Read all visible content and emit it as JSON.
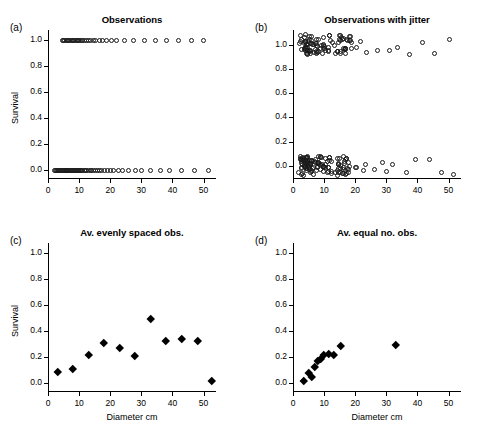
{
  "figure": {
    "panels": [
      {
        "label": "(a)",
        "title": "Observations",
        "ylabel": "Survival",
        "xlabel": ""
      },
      {
        "label": "(b)",
        "title": "Observations with jitter",
        "ylabel": "",
        "xlabel": ""
      },
      {
        "label": "(c)",
        "title": "Av. evenly spaced obs.",
        "ylabel": "Survival",
        "xlabel": "Diameter cm"
      },
      {
        "label": "(d)",
        "title": "Av. equal no. obs.",
        "ylabel": "",
        "xlabel": "Diameter cm"
      }
    ],
    "ytick_labels": [
      "0.0",
      "0.2",
      "0.4",
      "0.6",
      "0.8",
      "1.0"
    ],
    "xtick_labels": [
      "0",
      "10",
      "20",
      "30",
      "40",
      "50"
    ]
  },
  "chart_data": [
    {
      "id": "a",
      "type": "scatter",
      "title": "Observations",
      "panel_label": "(a)",
      "xlabel": "",
      "ylabel": "Survival",
      "xlim": [
        0,
        54
      ],
      "ylim": [
        -0.06,
        1.08
      ],
      "xticks": [
        0,
        10,
        20,
        30,
        40,
        50
      ],
      "yticks": [
        0.0,
        0.2,
        0.4,
        0.6,
        0.8,
        1.0
      ],
      "grid": false,
      "legend": "none",
      "marker": "open-circle",
      "points": [
        {
          "x": 2.0,
          "y": 0
        },
        {
          "x": 2.4,
          "y": 0
        },
        {
          "x": 2.8,
          "y": 0
        },
        {
          "x": 3.1,
          "y": 0
        },
        {
          "x": 3.4,
          "y": 0
        },
        {
          "x": 3.7,
          "y": 0
        },
        {
          "x": 4.0,
          "y": 0
        },
        {
          "x": 4.3,
          "y": 0
        },
        {
          "x": 4.6,
          "y": 0
        },
        {
          "x": 4.9,
          "y": 0
        },
        {
          "x": 5.2,
          "y": 0
        },
        {
          "x": 5.5,
          "y": 0
        },
        {
          "x": 5.8,
          "y": 0
        },
        {
          "x": 6.1,
          "y": 0
        },
        {
          "x": 6.4,
          "y": 0
        },
        {
          "x": 6.7,
          "y": 0
        },
        {
          "x": 7.0,
          "y": 0
        },
        {
          "x": 7.3,
          "y": 0
        },
        {
          "x": 7.6,
          "y": 0
        },
        {
          "x": 7.9,
          "y": 0
        },
        {
          "x": 8.2,
          "y": 0
        },
        {
          "x": 8.5,
          "y": 0
        },
        {
          "x": 8.8,
          "y": 0
        },
        {
          "x": 9.1,
          "y": 0
        },
        {
          "x": 9.4,
          "y": 0
        },
        {
          "x": 9.7,
          "y": 0
        },
        {
          "x": 10.0,
          "y": 0
        },
        {
          "x": 10.4,
          "y": 0
        },
        {
          "x": 10.8,
          "y": 0
        },
        {
          "x": 11.2,
          "y": 0
        },
        {
          "x": 11.6,
          "y": 0
        },
        {
          "x": 12.0,
          "y": 0
        },
        {
          "x": 12.5,
          "y": 0
        },
        {
          "x": 13.0,
          "y": 0
        },
        {
          "x": 13.5,
          "y": 0
        },
        {
          "x": 14.0,
          "y": 0
        },
        {
          "x": 14.6,
          "y": 0
        },
        {
          "x": 15.2,
          "y": 0
        },
        {
          "x": 15.8,
          "y": 0
        },
        {
          "x": 16.5,
          "y": 0
        },
        {
          "x": 17.2,
          "y": 0
        },
        {
          "x": 18.0,
          "y": 0
        },
        {
          "x": 19.0,
          "y": 0
        },
        {
          "x": 20.0,
          "y": 0
        },
        {
          "x": 21.0,
          "y": 0
        },
        {
          "x": 22.5,
          "y": 0
        },
        {
          "x": 24.0,
          "y": 0
        },
        {
          "x": 26.0,
          "y": 0
        },
        {
          "x": 28.0,
          "y": 0
        },
        {
          "x": 30.0,
          "y": 0
        },
        {
          "x": 33.0,
          "y": 0
        },
        {
          "x": 36.0,
          "y": 0
        },
        {
          "x": 39.0,
          "y": 0
        },
        {
          "x": 43.0,
          "y": 0
        },
        {
          "x": 47.0,
          "y": 0
        },
        {
          "x": 51.5,
          "y": 0
        },
        {
          "x": 4.5,
          "y": 1
        },
        {
          "x": 5.0,
          "y": 1
        },
        {
          "x": 5.4,
          "y": 1
        },
        {
          "x": 5.8,
          "y": 1
        },
        {
          "x": 6.2,
          "y": 1
        },
        {
          "x": 6.6,
          "y": 1
        },
        {
          "x": 7.0,
          "y": 1
        },
        {
          "x": 7.4,
          "y": 1
        },
        {
          "x": 7.8,
          "y": 1
        },
        {
          "x": 8.2,
          "y": 1
        },
        {
          "x": 8.6,
          "y": 1
        },
        {
          "x": 9.0,
          "y": 1
        },
        {
          "x": 9.4,
          "y": 1
        },
        {
          "x": 9.8,
          "y": 1
        },
        {
          "x": 10.2,
          "y": 1
        },
        {
          "x": 10.7,
          "y": 1
        },
        {
          "x": 11.2,
          "y": 1
        },
        {
          "x": 11.8,
          "y": 1
        },
        {
          "x": 12.4,
          "y": 1
        },
        {
          "x": 13.0,
          "y": 1
        },
        {
          "x": 13.7,
          "y": 1
        },
        {
          "x": 14.5,
          "y": 1
        },
        {
          "x": 15.4,
          "y": 1
        },
        {
          "x": 16.4,
          "y": 1
        },
        {
          "x": 17.5,
          "y": 1
        },
        {
          "x": 18.8,
          "y": 1
        },
        {
          "x": 20.3,
          "y": 1
        },
        {
          "x": 22.0,
          "y": 1
        },
        {
          "x": 24.5,
          "y": 1
        },
        {
          "x": 27.5,
          "y": 1
        },
        {
          "x": 31.0,
          "y": 1
        },
        {
          "x": 34.5,
          "y": 1
        },
        {
          "x": 38.0,
          "y": 1
        },
        {
          "x": 42.0,
          "y": 1
        },
        {
          "x": 46.0,
          "y": 1
        },
        {
          "x": 50.0,
          "y": 1
        }
      ]
    },
    {
      "id": "b",
      "type": "scatter",
      "title": "Observations with jitter",
      "panel_label": "(b)",
      "xlabel": "",
      "ylabel": "",
      "xlim": [
        0,
        54
      ],
      "ylim": [
        -0.1,
        1.12
      ],
      "xticks": [
        0,
        10,
        20,
        30,
        40,
        50
      ],
      "yticks": [
        0.0,
        0.2,
        0.4,
        0.6,
        0.8,
        1.0
      ],
      "grid": false,
      "legend": "none",
      "marker": "open-circle",
      "note": "Same data as panel (a) with random jitter added in x and y; dense cloud near x=5-15 at y~0 and y~1"
    },
    {
      "id": "c",
      "type": "scatter",
      "title": "Av. evenly spaced obs.",
      "panel_label": "(c)",
      "xlabel": "Diameter cm",
      "ylabel": "Survival",
      "xlim": [
        0,
        54
      ],
      "ylim": [
        -0.06,
        1.08
      ],
      "xticks": [
        0,
        10,
        20,
        30,
        40,
        50
      ],
      "yticks": [
        0.0,
        0.2,
        0.4,
        0.6,
        0.8,
        1.0
      ],
      "grid": false,
      "legend": "none",
      "marker": "filled-diamond",
      "points": [
        {
          "x": 3.0,
          "y": 0.09
        },
        {
          "x": 8.0,
          "y": 0.11
        },
        {
          "x": 13.0,
          "y": 0.22
        },
        {
          "x": 18.0,
          "y": 0.31
        },
        {
          "x": 23.0,
          "y": 0.27
        },
        {
          "x": 28.0,
          "y": 0.21
        },
        {
          "x": 33.0,
          "y": 0.5
        },
        {
          "x": 38.0,
          "y": 0.33
        },
        {
          "x": 43.0,
          "y": 0.34
        },
        {
          "x": 48.0,
          "y": 0.33
        },
        {
          "x": 52.5,
          "y": 0.02
        }
      ]
    },
    {
      "id": "d",
      "type": "scatter",
      "title": "Av. equal no. obs.",
      "panel_label": "(d)",
      "xlabel": "Diameter cm",
      "ylabel": "",
      "xlim": [
        0,
        54
      ],
      "ylim": [
        -0.06,
        1.08
      ],
      "xticks": [
        0,
        10,
        20,
        30,
        40,
        50
      ],
      "yticks": [
        0.0,
        0.2,
        0.4,
        0.6,
        0.8,
        1.0
      ],
      "grid": false,
      "legend": "none",
      "marker": "filled-diamond",
      "points": [
        {
          "x": 3.5,
          "y": 0.02
        },
        {
          "x": 5.0,
          "y": 0.08
        },
        {
          "x": 6.0,
          "y": 0.05
        },
        {
          "x": 7.0,
          "y": 0.13
        },
        {
          "x": 8.0,
          "y": 0.17
        },
        {
          "x": 9.0,
          "y": 0.19
        },
        {
          "x": 10.0,
          "y": 0.22
        },
        {
          "x": 11.5,
          "y": 0.23
        },
        {
          "x": 13.0,
          "y": 0.22
        },
        {
          "x": 15.5,
          "y": 0.29
        },
        {
          "x": 33.0,
          "y": 0.3
        }
      ]
    }
  ]
}
